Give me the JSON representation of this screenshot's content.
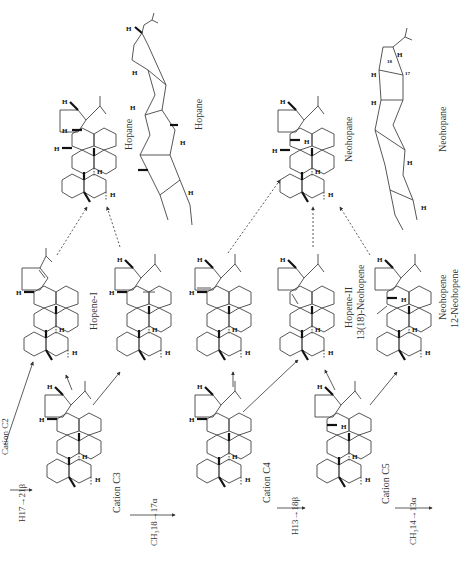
{
  "diagram": {
    "orientation": "rotated 90° counter-clockwise",
    "nodes": [
      {
        "id": "cation_c2",
        "label": "Cation C2",
        "kind": "cation"
      },
      {
        "id": "cation_c3",
        "label": "Cation C3",
        "kind": "cation"
      },
      {
        "id": "cation_c4",
        "label": "Cation C4",
        "kind": "cation"
      },
      {
        "id": "cation_c5",
        "label": "Cation C5",
        "kind": "cation"
      },
      {
        "id": "hopene_i",
        "label": "Hopene-I",
        "kind": "alkene"
      },
      {
        "id": "hopene_ii",
        "label": "Hopene-II",
        "sublabel": "13(18)-Neohopene",
        "kind": "alkene"
      },
      {
        "id": "neohopene",
        "label": "Neohopene",
        "sublabel": "12-Neohopene",
        "kind": "alkene"
      },
      {
        "id": "hopane",
        "label": "Hopane",
        "kind": "alkane"
      },
      {
        "id": "hopane_3d",
        "label": "Hopane",
        "kind": "conformation"
      },
      {
        "id": "neohopane",
        "label": "Neohopane",
        "kind": "alkane"
      },
      {
        "id": "neohopane_3d",
        "label": "Neohopane",
        "kind": "conformation"
      }
    ],
    "shifts": [
      {
        "from": "cation_c2",
        "to": "cation_c3",
        "label": "H17→21β"
      },
      {
        "from": "cation_c3",
        "to": "cation_c4",
        "label": "CH₃18→17α"
      },
      {
        "from": "cation_c4",
        "to": "cation_c5",
        "label": "H13→18β"
      },
      {
        "from": "cation_c5",
        "to": "next",
        "label": "CH₃14→13α"
      }
    ],
    "labels": {
      "cation_c2": "Cation C2",
      "h17_21b": "H17→21β",
      "cation_c3": "Cation C3",
      "ch3_18_17a": "CH₃18→17α",
      "cation_c4": "Cation C4",
      "h13_18b": "H13→18β",
      "cation_c5": "Cation C5",
      "ch3_14_13a": "CH₃14→13α",
      "hopene_i": "Hopene-I",
      "hopene_ii": "Hopene-II",
      "neohopene_13_18": "13(18)-Neohopene",
      "neohopene": "Neohopene",
      "neohopene_12": "12-Neohopene",
      "hopane": "Hopane",
      "hopane_3d": "Hopane",
      "neohopane": "Neohopane",
      "neohopane_3d": "Neohopane",
      "atom_h": "H",
      "pos_17": "17",
      "pos_18": "18"
    }
  }
}
